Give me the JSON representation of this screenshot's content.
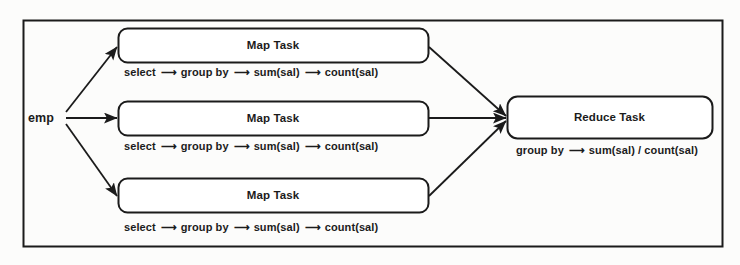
{
  "diagram": {
    "frame": {
      "name": "outer-frame"
    },
    "source": {
      "label": "emp"
    },
    "arrow_glyph": "⟶",
    "map_tasks": [
      {
        "title": "Map Task",
        "pipeline": [
          "select",
          "group by",
          "sum(sal)",
          "count(sal)"
        ]
      },
      {
        "title": "Map Task",
        "pipeline": [
          "select",
          "group by",
          "sum(sal)",
          "count(sal)"
        ]
      },
      {
        "title": "Map Task",
        "pipeline": [
          "select",
          "group by",
          "sum(sal)",
          "count(sal)"
        ]
      }
    ],
    "reduce_task": {
      "title": "Reduce Task",
      "pipeline": [
        "group by",
        "sum(sal) / count(sal)"
      ]
    },
    "colors": {
      "background": "#fcfcfb",
      "stroke": "#1b1b1b",
      "text": "#1b1b1b",
      "box_fill": "#ffffff"
    }
  }
}
